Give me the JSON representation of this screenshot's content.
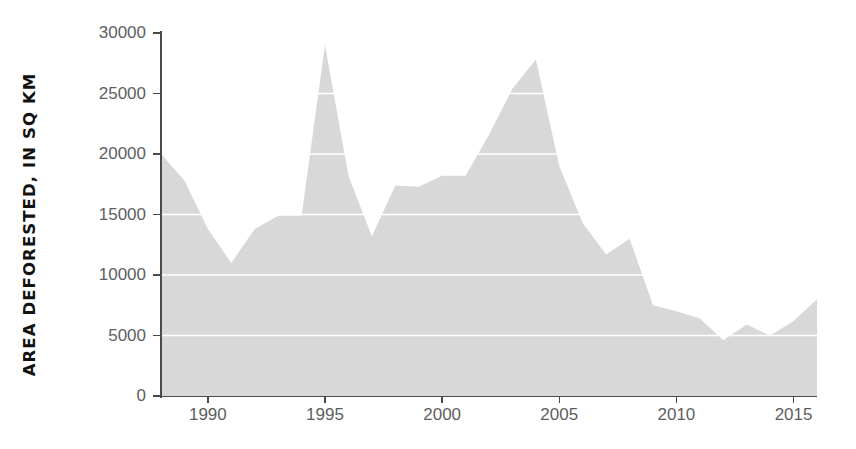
{
  "chart_data": {
    "type": "area",
    "title": "",
    "xlabel": "",
    "ylabel": "AREA DEFORESTED, IN SQ KM",
    "xlim": [
      1988,
      2016
    ],
    "ylim": [
      0,
      30000
    ],
    "grid": true,
    "legend": null,
    "fill_color": "#d8d8d8",
    "grid_color": "#ffffff",
    "axis_color": "#4a4a4a",
    "tick_label_color": "#5e5e5e",
    "background_color": "#ffffff",
    "x": [
      1988,
      1989,
      1990,
      1991,
      1992,
      1993,
      1994,
      1995,
      1996,
      1997,
      1998,
      1999,
      2000,
      2001,
      2002,
      2003,
      2004,
      2005,
      2006,
      2007,
      2008,
      2009,
      2010,
      2011,
      2012,
      2013,
      2014,
      2015,
      2016
    ],
    "values": [
      20000,
      17800,
      13800,
      11000,
      13800,
      14900,
      14900,
      29000,
      18200,
      13200,
      17400,
      17300,
      18200,
      18200,
      21600,
      25400,
      27800,
      19000,
      14300,
      11700,
      13000,
      7500,
      7000,
      6400,
      4600,
      5900,
      5000,
      6200,
      8000
    ],
    "y_ticks": [
      0,
      5000,
      10000,
      15000,
      20000,
      25000,
      30000
    ],
    "y_tick_labels": [
      "0",
      "5000",
      "10000",
      "15000",
      "20000",
      "25000",
      "30000"
    ],
    "x_ticks": [
      1990,
      1995,
      2000,
      2005,
      2010,
      2015
    ],
    "x_tick_labels": [
      "1990",
      "1995",
      "2000",
      "2005",
      "2010",
      "2015"
    ]
  }
}
